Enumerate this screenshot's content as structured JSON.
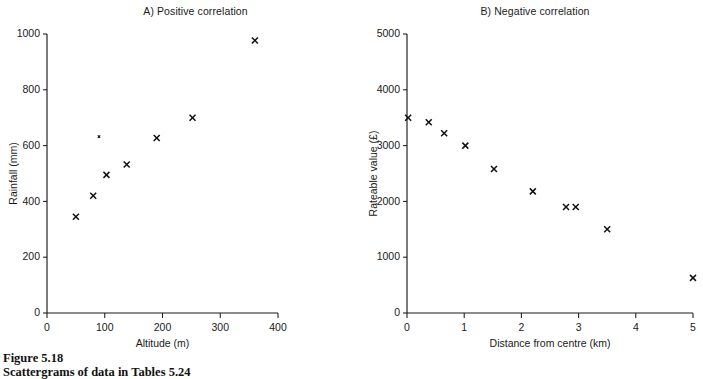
{
  "figure": {
    "caption_title": "Figure 5.18",
    "caption_subtitle": "Scattergrams of data in Tables 5.24"
  },
  "chart_data": [
    {
      "type": "scatter",
      "title": "A)  Positive correlation",
      "xlabel": "Altitude (m)",
      "ylabel": "Rainfall (mm)",
      "xlim": [
        0,
        400
      ],
      "ylim": [
        0,
        1000
      ],
      "xticks": [
        0,
        100,
        200,
        300,
        400
      ],
      "yticks": [
        0,
        200,
        400,
        600,
        800,
        1000
      ],
      "xticklabels": [
        "0",
        "100",
        "200",
        "300",
        "400"
      ],
      "yticklabels": [
        "0",
        "200",
        "400",
        "600",
        "800",
        "1000"
      ],
      "grid": false,
      "legend": "none",
      "marker": "x",
      "points": [
        {
          "x": 50,
          "y": 345
        },
        {
          "x": 80,
          "y": 420
        },
        {
          "x": 90,
          "y": 632,
          "small": true
        },
        {
          "x": 103,
          "y": 495
        },
        {
          "x": 138,
          "y": 532
        },
        {
          "x": 190,
          "y": 627
        },
        {
          "x": 252,
          "y": 700
        },
        {
          "x": 360,
          "y": 977
        }
      ]
    },
    {
      "type": "scatter",
      "title": "B)  Negative correlation",
      "xlabel": "Distance from centre (km)",
      "ylabel": "Rateable value (£)",
      "xlim": [
        0,
        5
      ],
      "ylim": [
        0,
        5000
      ],
      "xticks": [
        0,
        1,
        2,
        3,
        4,
        5
      ],
      "yticks": [
        0,
        1000,
        2000,
        3000,
        4000,
        5000
      ],
      "xticklabels": [
        "0",
        "1",
        "2",
        "3",
        "4",
        "5"
      ],
      "yticklabels": [
        "0",
        "1000",
        "2000",
        "3000",
        "4000",
        "5000"
      ],
      "grid": false,
      "legend": "none",
      "marker": "x",
      "points": [
        {
          "x": 0.02,
          "y": 3500
        },
        {
          "x": 0.38,
          "y": 3420
        },
        {
          "x": 0.65,
          "y": 3220
        },
        {
          "x": 1.02,
          "y": 3000
        },
        {
          "x": 1.52,
          "y": 2580
        },
        {
          "x": 2.2,
          "y": 2180
        },
        {
          "x": 2.78,
          "y": 1900
        },
        {
          "x": 2.95,
          "y": 1900
        },
        {
          "x": 3.5,
          "y": 1500
        },
        {
          "x": 5.0,
          "y": 630
        }
      ]
    }
  ]
}
